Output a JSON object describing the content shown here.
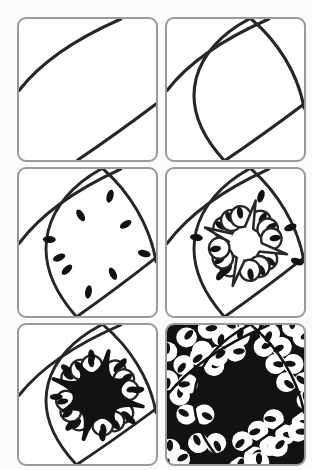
{
  "meta": {
    "panel_count": 6,
    "layout": "2 columns x 3 rows of rounded square tiles"
  },
  "colors": {
    "page_background": "#fbfbfa",
    "tile_background": "#ffffff",
    "tile_border": "#9a9a9a",
    "ink": "#272727",
    "fill_black": "#121212"
  },
  "panels": [
    {
      "step": 1,
      "name": "guide-curves",
      "description": "Step 1: two parallel curved guide lines drawn across the blank tile"
    },
    {
      "step": 2,
      "name": "curved-grid",
      "description": "Step 2: two crossing curves added, forming a curved grid with a central cell"
    },
    {
      "step": 3,
      "name": "seed-ring",
      "description": "Step 3: small black seed shapes scattered around the inside of the central cell",
      "seed_count": 9
    },
    {
      "step": 4,
      "name": "scallop-star",
      "description": "Step 4: scallop arcs cup each seed, leaving a white four-pointed star in the center",
      "scallop_count": 12,
      "outer_seed_count": 5
    },
    {
      "step": 5,
      "name": "inked-star",
      "description": "Step 5: the central star is inked solid black with eight spiky arms",
      "arm_count": 8
    },
    {
      "step": 6,
      "name": "finished-tile",
      "description": "Step 6: the whole tile is filled; black stars tessellate between white scalloped bands of seeds"
    }
  ]
}
